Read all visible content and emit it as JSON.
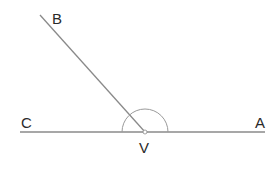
{
  "diagram": {
    "type": "angle",
    "vertex": {
      "label": "V",
      "x": 145,
      "y": 132
    },
    "rays": [
      {
        "label": "A",
        "end_x": 265,
        "end_y": 132
      },
      {
        "label": "B",
        "end_x": 40,
        "end_y": 15
      },
      {
        "label": "C",
        "end_x": 20,
        "end_y": 132
      }
    ],
    "angle_arc": {
      "from": "A",
      "to": "C",
      "radius": 23,
      "description": "arc marking angle from ray VA to ray VC over top"
    },
    "labels": {
      "A": "A",
      "B": "B",
      "C": "C",
      "V": "V"
    },
    "colors": {
      "line": "#8a8a8a",
      "text": "#2a2a2a",
      "background": "#ffffff"
    }
  }
}
